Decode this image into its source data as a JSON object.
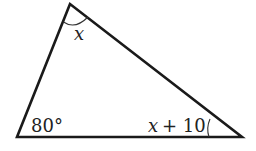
{
  "diagram": {
    "type": "triangle",
    "vertices": {
      "top": [
        70,
        4
      ],
      "bottom_left": [
        17,
        137
      ],
      "bottom_right": [
        242,
        137
      ]
    },
    "angles": {
      "top": "x",
      "bottom_left": "80°",
      "bottom_right_var": "x",
      "bottom_right_rest": "+ 10"
    },
    "colors": {
      "stroke": "#1a1a1a",
      "text": "#222222"
    }
  }
}
